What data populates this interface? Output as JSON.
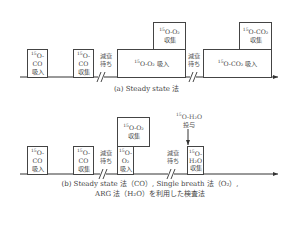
{
  "panel_a": {
    "caption": "(a) Steady state 法",
    "boxes": [
      {
        "iso": "15",
        "formula": "O-CO",
        "action": "吸入"
      },
      {
        "iso": "15",
        "formula": "O-CO",
        "action": "収集"
      },
      {
        "iso": "15",
        "formula": "O-O₂",
        "action": "吸入"
      },
      {
        "iso": "15",
        "formula": "O-O₂",
        "action": "収集"
      },
      {
        "iso": "15",
        "formula": "O-CO₂",
        "action": "吸入"
      },
      {
        "iso": "15",
        "formula": "O-CO₂",
        "action": "収集"
      }
    ],
    "waits": [
      "減衰",
      "待ち"
    ]
  },
  "panel_b": {
    "caption_line1": "(b) Steady state 法（CO）, Single breath 法（O₂）,",
    "caption_line2": "ARG 法（H₂O）を利用した検査法",
    "boxes": [
      {
        "iso": "15",
        "formula": "O-CO",
        "action": "吸入"
      },
      {
        "iso": "15",
        "formula": "O-CO",
        "action": "収集"
      },
      {
        "iso": "15",
        "formula": "O-O₂",
        "action": "吸入"
      },
      {
        "iso": "15",
        "formula": "O-O₂",
        "action": "収集"
      },
      {
        "iso": "15",
        "formula_a": "O-",
        "formula_b": "H₂O",
        "action": "収集"
      }
    ],
    "injection": {
      "iso": "15",
      "formula": "O-H₂O",
      "action": "投与"
    },
    "waits": [
      "減衰",
      "待ち"
    ]
  }
}
